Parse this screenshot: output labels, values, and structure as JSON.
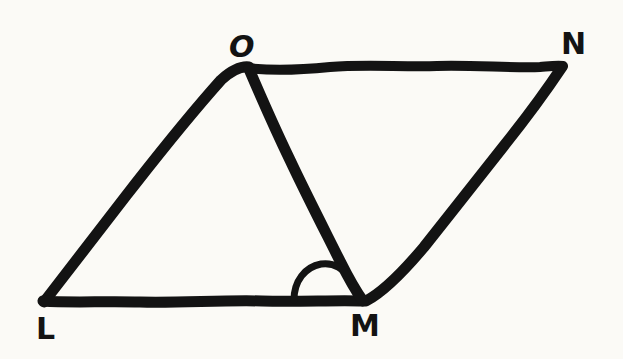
{
  "figure": {
    "kind": "hand-drawn-geometry-diagram",
    "background_color": "#fbfaf6",
    "stroke_color": "#131313",
    "canvas": {
      "width": 623,
      "height": 359
    },
    "vertices": [
      {
        "id": "L",
        "label": "L",
        "x": 42,
        "y": 300,
        "label_x": 43,
        "label_y": 330
      },
      {
        "id": "M",
        "label": "M",
        "x": 362,
        "y": 300,
        "label_x": 364,
        "label_y": 327
      },
      {
        "id": "N",
        "label": "N",
        "x": 562,
        "y": 66,
        "label_x": 574,
        "label_y": 45
      },
      {
        "id": "O",
        "label": "O",
        "x": 248,
        "y": 68,
        "label_x": 241,
        "label_y": 48
      }
    ],
    "edges": [
      {
        "id": "LO",
        "from": "L",
        "to": "O",
        "kind": "side"
      },
      {
        "id": "ON",
        "from": "O",
        "to": "N",
        "kind": "side"
      },
      {
        "id": "NM",
        "from": "N",
        "to": "M",
        "kind": "side"
      },
      {
        "id": "ML",
        "from": "M",
        "to": "L",
        "kind": "side"
      },
      {
        "id": "OM",
        "from": "O",
        "to": "M",
        "kind": "diagonal"
      }
    ],
    "angle_marks": [
      {
        "id": "angle-LMO",
        "at_vertex": "M",
        "between": [
          "L",
          "O"
        ],
        "arcs": 1
      }
    ]
  }
}
